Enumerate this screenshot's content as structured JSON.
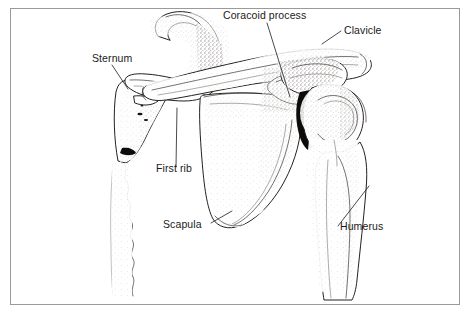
{
  "figure": {
    "background_color": "#ffffff",
    "frame_color": "#9a9a9a",
    "ink_color": "#23211f",
    "label_color": "#1a1a1a"
  },
  "labels": {
    "coracoid_process": "Coracoid process",
    "clavicle": "Clavicle",
    "sternum": "Sternum",
    "first_rib": "First rib",
    "scapula": "Scapula",
    "humerus": "Humerus"
  },
  "label_positions": {
    "coracoid_process": {
      "x": 223,
      "y": 19
    },
    "clavicle": {
      "x": 344,
      "y": 34
    },
    "sternum": {
      "x": 92,
      "y": 62
    },
    "first_rib": {
      "x": 156,
      "y": 172
    },
    "scapula": {
      "x": 163,
      "y": 228
    },
    "humerus": {
      "x": 340,
      "y": 230
    }
  },
  "leader_lines": {
    "coracoid_process": "M 267 23 L 290 97",
    "clavicle": "M 341 31 L 322 44",
    "sternum": "M 112 65 L 128 89",
    "first_rib": "M 176 167 L 177 108",
    "scapula": "M 211 223 L 232 211",
    "humerus": "M 338 226 L 369 186"
  },
  "bones": [
    {
      "name": "sternum",
      "description": "manubrium and sternal body with wavy inferior border"
    },
    {
      "name": "first-rib",
      "description": "hooked first rib arching up and over"
    },
    {
      "name": "clavicle",
      "description": "S-shaped collarbone running laterally"
    },
    {
      "name": "scapula",
      "description": "triangular shoulder blade with spine and glenoid"
    },
    {
      "name": "coracoid-process",
      "description": "beak-like process of the scapula"
    },
    {
      "name": "humerus",
      "description": "upper arm bone with rounded head and shaft"
    },
    {
      "name": "glenohumeral-joint-space",
      "description": "dark joint space at shoulder"
    }
  ]
}
